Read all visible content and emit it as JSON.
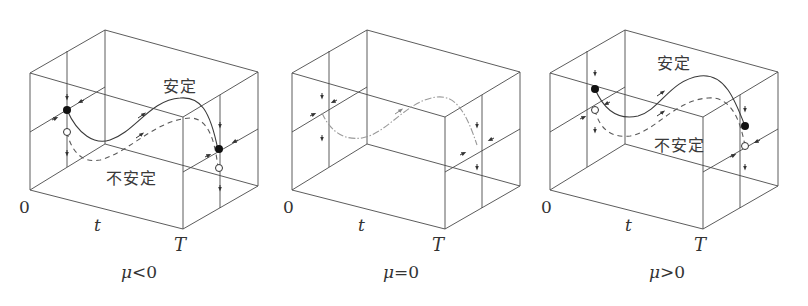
{
  "figure": {
    "panels": [
      {
        "id": "mu-negative",
        "caption_symbol": "μ",
        "caption_rel": "<0",
        "axis_origin": "0",
        "axis_var": "t",
        "axis_end": "T",
        "stable_label": "安定",
        "unstable_label": "不安定",
        "curves": [
          "stable (solid)",
          "unstable (dashed)"
        ],
        "fixed_points": [
          "stable filled dot at t=0 (upper)",
          "unstable open dot at t=0 (lower)",
          "stable filled dot at t=T",
          "unstable open dot at t=T"
        ]
      },
      {
        "id": "mu-zero",
        "caption_symbol": "μ",
        "caption_rel": "=0",
        "axis_origin": "0",
        "axis_var": "t",
        "axis_end": "T",
        "curves": [
          "neutral (gray dash-dot)"
        ]
      },
      {
        "id": "mu-positive",
        "caption_symbol": "μ",
        "caption_rel": ">0",
        "axis_origin": "0",
        "axis_var": "t",
        "axis_end": "T",
        "stable_label": "安定",
        "unstable_label": "不安定",
        "curves": [
          "stable (solid)",
          "unstable (dashed)"
        ],
        "fixed_points": [
          "stable filled dot at t=0 (upper)",
          "unstable open dot at t=0 (lower)",
          "stable filled dot at t=T (upper)",
          "unstable open dot at t=T (lower)"
        ]
      }
    ],
    "colors": {
      "line": "#4a4a4a",
      "neutral_curve": "#9a9a9a",
      "background": "#ffffff"
    }
  }
}
